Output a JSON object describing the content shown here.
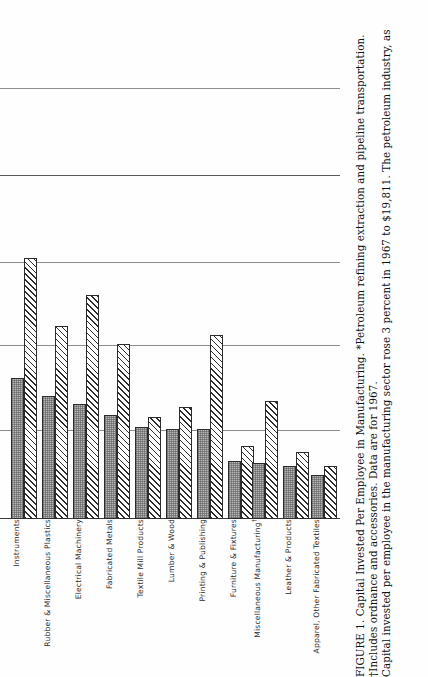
{
  "figure": {
    "label": "FIGURE 1.",
    "caption_lines": [
      "FIGURE 1. Capital Invested Per Employee in Manufacturing. *Petroleum refining extraction and pipeline transportation.",
      "†Includes ordnance and accessories. Data are for 1967.",
      "Capital invested per employee in the manufacturing sector rose 3 percent in 1967 to $19,811. The petroleum industry, as"
    ],
    "title": "Capital Invested Per Employee in Manufacturing.",
    "footnote_asterisk": "*Petroleum refining extraction and pipeline transportation.",
    "footnote_dagger": "†Includes ordnance and accessories. Data are for 1967.",
    "body_text": "Capital invested per employee in the manufacturing sector rose 3 percent in 1967 to $19,811. The petroleum industry, as"
  },
  "chart_data": {
    "type": "bar",
    "title": "Capital Invested Per Employee in Manufacturing",
    "xlabel": "",
    "ylabel": "",
    "grid": true,
    "legend_position": "none",
    "orientation": "vertical-bars-on-rotated-page",
    "gridline_pixel_rows": [
      88,
      175,
      262,
      345,
      430,
      518
    ],
    "categories": [
      "Instruments",
      "Rubber & Miscellaneous Plastics",
      "Electrical Machinery",
      "Fabricated Metals",
      "Textile Mill Products",
      "Lumber & Wood",
      "Printing & Publishing",
      "Furniture & Fixtures",
      "Miscellaneous Manufacturing†",
      "Leather & Products",
      "Apparel, Other Fabricated Textiles"
    ],
    "series": [
      {
        "name": "Series 1 (solid gray)",
        "pattern": "stipple-gray",
        "values": [
          141,
          123,
          115,
          104,
          92,
          90,
          90,
          58,
          56,
          53,
          44
        ]
      },
      {
        "name": "Series 2 (hatched)",
        "pattern": "diagonal-hatch",
        "values": [
          261,
          193,
          224,
          175,
          102,
          112,
          184,
          73,
          118,
          67,
          53
        ]
      }
    ],
    "value_unit": "pixel-height (unlabeled axis on scan)",
    "ylim": [
      0,
      280
    ]
  },
  "colors": {
    "bar_series1": "#b9b9b9",
    "bar_series2": "#ffffff",
    "bar_outline": "#2c2c2c",
    "gridline": "#5a5a5a",
    "page_background": "#fefefe",
    "text": "#1a1a1a"
  }
}
